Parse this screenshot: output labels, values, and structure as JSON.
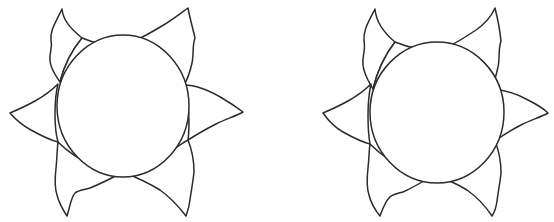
{
  "canvas": {
    "width": 554,
    "height": 222,
    "background_color": "#ffffff",
    "line_color": "#2b2b2b",
    "fill_color": "#ffffff",
    "stroke_width": 1.5,
    "description": "Two hand-drawn black outline sun / flower shapes side by side on a plain white background, each with a large central circle surrounded by six pointed petals / rays."
  },
  "figures": [
    {
      "name": "sun-left",
      "label": "Left sun outline",
      "center": {
        "x": 123,
        "y": 108
      },
      "disc": {
        "cx": 123,
        "cy": 106,
        "rx": 66,
        "ry": 71
      },
      "petal_count": 6,
      "petal_tips": [
        {
          "name": "petal-tip-upper-left",
          "x": 62,
          "y": 9
        },
        {
          "name": "petal-tip-upper-right",
          "x": 188,
          "y": 8
        },
        {
          "name": "petal-tip-right",
          "x": 243,
          "y": 112
        },
        {
          "name": "petal-tip-lower-right",
          "x": 186,
          "y": 216
        },
        {
          "name": "petal-tip-lower-left",
          "x": 67,
          "y": 216
        },
        {
          "name": "petal-tip-left",
          "x": 10,
          "y": 113
        }
      ]
    },
    {
      "name": "sun-right",
      "label": "Right sun outline",
      "center": {
        "x": 436,
        "y": 112
      },
      "disc": {
        "cx": 436,
        "cy": 112,
        "rx": 67,
        "ry": 71
      },
      "petal_count": 6,
      "petal_tips": [
        {
          "name": "petal-tip-upper-left",
          "x": 375,
          "y": 9
        },
        {
          "name": "petal-tip-upper-right",
          "x": 495,
          "y": 8
        },
        {
          "name": "petal-tip-right",
          "x": 548,
          "y": 113
        },
        {
          "name": "petal-tip-lower-right",
          "x": 492,
          "y": 216
        },
        {
          "name": "petal-tip-lower-left",
          "x": 380,
          "y": 216
        },
        {
          "name": "petal-tip-left",
          "x": 323,
          "y": 113
        }
      ]
    }
  ]
}
